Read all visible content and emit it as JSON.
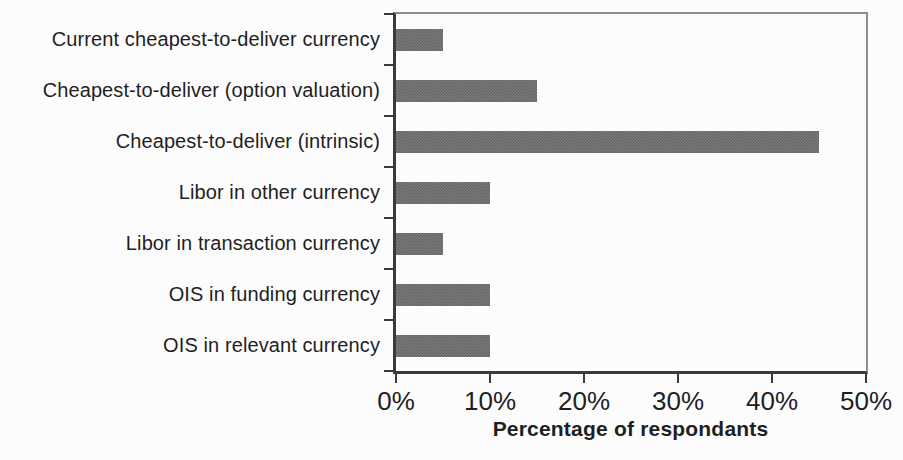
{
  "figure": {
    "colors": {
      "background": "#fcfcfc",
      "text_color": "#1f1f1f",
      "axis_color": "#3a3a3a",
      "frame_color": "#8f8f8f",
      "bar_color_light": "#7d7d7d",
      "bar_color_dark": "#5e5e5e"
    }
  },
  "chart_data": {
    "type": "bar",
    "orientation": "horizontal",
    "title": "",
    "categories": [
      "Current cheapest-to-deliver currency",
      "Cheapest-to-deliver (option valuation)",
      "Cheapest-to-deliver (intrinsic)",
      "Libor in other currency",
      "Libor in transaction currency",
      "OIS in funding currency",
      "OIS in relevant currency"
    ],
    "values": [
      5,
      15,
      45,
      10,
      5,
      10,
      10
    ],
    "xlabel": "Percentage of respondants",
    "ylabel": "",
    "xlim": [
      0,
      50
    ],
    "x_tick_values": [
      0,
      10,
      20,
      30,
      40,
      50
    ],
    "x_ticks": [
      "0%",
      "10%",
      "20%",
      "30%",
      "40%",
      "50%"
    ],
    "grid": false,
    "legend": "none"
  }
}
